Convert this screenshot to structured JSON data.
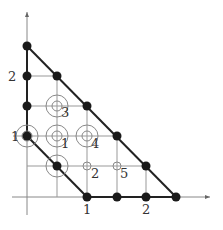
{
  "diagram": {
    "type": "lattice-polytope",
    "grid_origin_px": [
      27,
      197
    ],
    "grid_step_px": 30,
    "colors": {
      "thick_line": "#222222",
      "thin_line": "#999999",
      "axis": "#888888",
      "dot": "#1a1a1a",
      "circle": "#888888",
      "label": "#333333"
    },
    "axis_labels": {
      "y_2": "2",
      "x_1": "1",
      "x_2": "2"
    },
    "filled_points": [
      [
        0,
        5
      ],
      [
        0,
        4
      ],
      [
        1,
        4
      ],
      [
        0,
        3
      ],
      [
        2,
        3
      ],
      [
        0,
        2
      ],
      [
        3,
        2
      ],
      [
        1,
        1
      ],
      [
        4,
        1
      ],
      [
        2,
        0
      ],
      [
        3,
        0
      ],
      [
        4,
        0
      ],
      [
        5,
        0
      ]
    ],
    "double_circles": [
      {
        "at": [
          1,
          3
        ],
        "label": "3"
      },
      {
        "at": [
          1,
          2
        ],
        "label": "1"
      },
      {
        "at": [
          2,
          2
        ],
        "label": "4"
      },
      {
        "at": [
          0,
          2
        ],
        "label": "1"
      },
      {
        "at": [
          1,
          1
        ],
        "label": ""
      }
    ],
    "small_circles": [
      {
        "at": [
          2,
          1
        ],
        "label": "2"
      },
      {
        "at": [
          3,
          1
        ],
        "label": "5"
      }
    ]
  }
}
